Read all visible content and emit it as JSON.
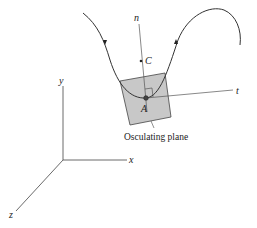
{
  "figure": {
    "type": "osculating-plane-diagram",
    "labels": {
      "normal": "n",
      "center": "C",
      "tangent": "t",
      "point": "A",
      "plane_caption": "Osculating plane",
      "axis_x": "x",
      "axis_y": "y",
      "axis_z": "z"
    },
    "colors": {
      "line": "#333333",
      "plane_fill": "#c8c8c8",
      "plane_stroke": "#444444",
      "background": "#ffffff"
    }
  }
}
